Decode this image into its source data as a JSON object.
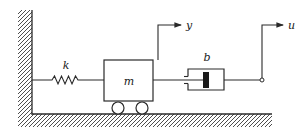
{
  "diagram": {
    "colors": {
      "stroke": "#2a2a2a",
      "background": "#ffffff",
      "piston": "#1a1a1a"
    },
    "labels": {
      "spring": "k",
      "mass": "m",
      "damper": "b",
      "mass_displacement": "y",
      "input_displacement": "u"
    }
  }
}
